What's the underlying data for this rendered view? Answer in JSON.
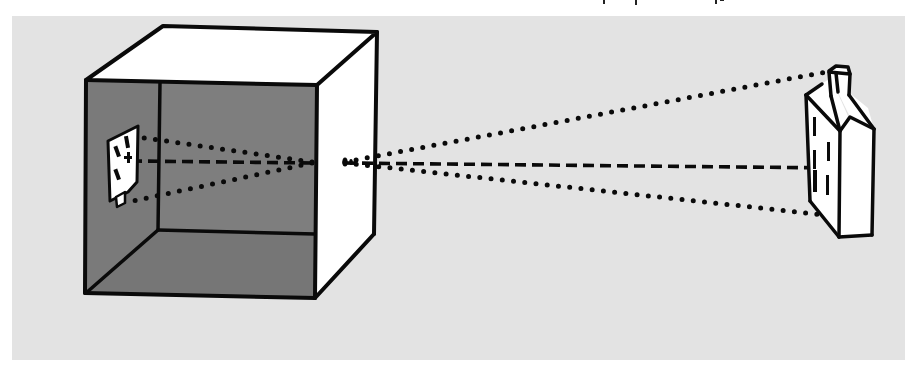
{
  "figure": {
    "colors": {
      "page": "#ffffff",
      "panel": "#e3e3e3",
      "box_interior": "#7a7a7a",
      "box_exterior": "#ffffff",
      "ink": "#0a0a0a"
    },
    "panel": {
      "x": 12,
      "y": 16,
      "width": 893,
      "height": 344
    },
    "box": {
      "front_top_left": [
        86,
        80
      ],
      "front_top_right": [
        317,
        85
      ],
      "front_bottom_left": [
        85,
        293
      ],
      "front_bottom_right": [
        315,
        298
      ],
      "back_top_left": [
        163,
        26
      ],
      "back_top_right": [
        377,
        32
      ],
      "back_bottom_right": [
        374,
        234
      ],
      "inner_back_bottom_left": [
        158,
        230
      ],
      "inner_back_bottom_right": [
        315,
        234
      ]
    },
    "pinhole": {
      "x": 345,
      "y": 162
    },
    "projected_image": {
      "label": "inverted-house-image",
      "center": [
        123,
        163
      ]
    },
    "object": {
      "label": "house",
      "center": [
        842,
        160
      ]
    },
    "rays": [
      {
        "name": "top-ray-outside",
        "style": "dotted",
        "from": [
          345,
          162
        ],
        "to": [
          826,
          72
        ]
      },
      {
        "name": "center-ray-outside",
        "style": "dashed",
        "from": [
          345,
          163
        ],
        "to": [
          838,
          168
        ]
      },
      {
        "name": "bottom-ray-outside",
        "style": "dotted",
        "from": [
          345,
          163
        ],
        "to": [
          834,
          216
        ]
      },
      {
        "name": "top-ray-inside",
        "style": "dotted",
        "from": [
          312,
          163
        ],
        "to": [
          128,
          202
        ]
      },
      {
        "name": "center-ray-inside",
        "style": "dashed",
        "from": [
          312,
          163
        ],
        "to": [
          135,
          161
        ]
      },
      {
        "name": "bottom-ray-inside",
        "style": "dotted",
        "from": [
          312,
          162
        ],
        "to": [
          138,
          137
        ]
      }
    ]
  }
}
